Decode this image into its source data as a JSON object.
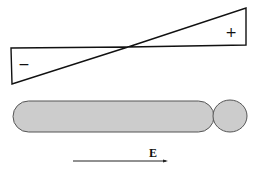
{
  "diagram": {
    "potential_profile": {
      "negative_label": "−",
      "positive_label": "+"
    },
    "cell": {
      "rod_fill": "#cccccc",
      "bead_fill": "#cccccc",
      "stroke": "#555555"
    },
    "field": {
      "label": "E",
      "direction": "right"
    }
  }
}
